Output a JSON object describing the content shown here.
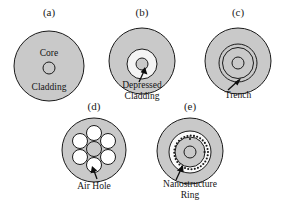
{
  "figure": {
    "background_color": "#ffffff",
    "cladding_fill": "#c9c9c9",
    "hole_fill": "#ffffff",
    "stroke_color": "#1a1a1a"
  },
  "panels": [
    {
      "id": "a",
      "label": "(a)",
      "annotations": [
        {
          "name": "core",
          "text": "Core"
        },
        {
          "name": "cladding",
          "text": "Cladding"
        }
      ]
    },
    {
      "id": "b",
      "label": "(b)",
      "annotations": [
        {
          "name": "depressed-cladding",
          "line1": "Depressed",
          "line2": "Cladding"
        }
      ]
    },
    {
      "id": "c",
      "label": "(c)",
      "annotations": [
        {
          "name": "trench",
          "text": "Trench"
        }
      ]
    },
    {
      "id": "d",
      "label": "(d)",
      "annotations": [
        {
          "name": "air-hole",
          "text": "Air Hole"
        }
      ],
      "air_hole_count": 6
    },
    {
      "id": "e",
      "label": "(e)",
      "annotations": [
        {
          "name": "nanostructure-ring",
          "line1": "Nanostructure",
          "line2": "Ring"
        }
      ],
      "nanostructure_dot_count": 34
    }
  ]
}
